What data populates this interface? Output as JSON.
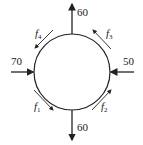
{
  "diagram": {
    "type": "traffic-circle-network",
    "circle": {
      "cx": 72,
      "cy": 72,
      "r": 38,
      "stroke": "#222222"
    },
    "external_flows": [
      {
        "id": "top",
        "label": "60",
        "direction": "out"
      },
      {
        "id": "right",
        "label": "50",
        "direction": "in"
      },
      {
        "id": "bottom",
        "label": "60",
        "direction": "out"
      },
      {
        "id": "left",
        "label": "70",
        "direction": "in"
      }
    ],
    "internal_flows": [
      {
        "id": "f1",
        "base": "f",
        "sub": "1",
        "position": "bottom-left"
      },
      {
        "id": "f2",
        "base": "f",
        "sub": "2",
        "position": "bottom-right"
      },
      {
        "id": "f3",
        "base": "f",
        "sub": "3",
        "position": "top-right"
      },
      {
        "id": "f4",
        "base": "f",
        "sub": "4",
        "position": "top-left"
      }
    ]
  }
}
